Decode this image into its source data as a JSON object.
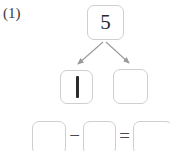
{
  "worksheet": {
    "problem_label": "(1)",
    "number_bond": {
      "whole": {
        "value": "5",
        "filled": true
      },
      "parts": [
        {
          "value": "1",
          "filled": true,
          "handwritten": true
        },
        {
          "value": "",
          "filled": false
        }
      ],
      "arrow_count": 2
    },
    "equation": {
      "operands": [
        {
          "value": "",
          "filled": false
        },
        {
          "value": "",
          "filled": false
        }
      ],
      "result": {
        "value": "",
        "filled": false
      },
      "operator_minus": "−",
      "operator_equals": "="
    }
  },
  "colors": {
    "box_border": "#cfcfcf",
    "ink": "#2b2b2b",
    "label_text": "#3a3a3a",
    "arrow": "#9a9a9a",
    "operator": "#4a4a4a",
    "background": "#ffffff"
  }
}
